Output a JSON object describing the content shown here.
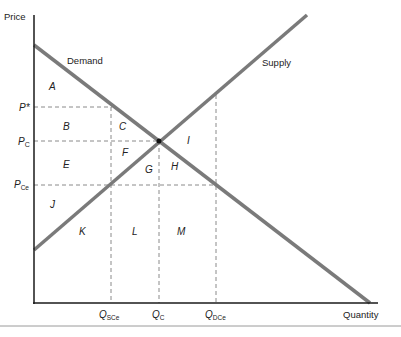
{
  "diagram": {
    "type": "supply-demand-price-ceiling",
    "axes": {
      "y_label": "Price",
      "x_label": "Quantity"
    },
    "curves": {
      "demand": "Demand",
      "supply": "Supply"
    },
    "price_labels": {
      "p_star": "P*",
      "p_c": "P",
      "p_c_sub": "C",
      "p_ce": "P",
      "p_ce_sub": "Ce"
    },
    "quantity_labels": {
      "q_sce": "Q",
      "q_sce_sub": "SCe",
      "q_c": "Q",
      "q_c_sub": "C",
      "q_dce": "Q",
      "q_dce_sub": "DCe"
    },
    "regions": {
      "A": "A",
      "B": "B",
      "C": "C",
      "E": "E",
      "F": "F",
      "G": "G",
      "H": "H",
      "I": "I",
      "J": "J",
      "K": "K",
      "L": "L",
      "M": "M"
    },
    "colors": {
      "curve": "#7a7a7a",
      "axis": "#1a1a1a",
      "dashed": "#888888",
      "text": "#222222"
    }
  }
}
